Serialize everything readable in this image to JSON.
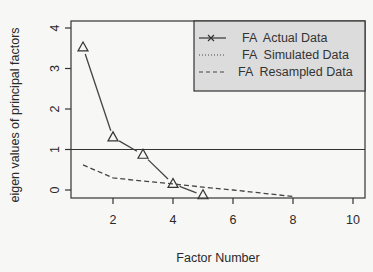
{
  "chart_data": {
    "type": "line",
    "title": "",
    "xlabel": "Factor Number",
    "ylabel": "eigen values of principal factors",
    "xlim": [
      0.6,
      10.4
    ],
    "ylim": [
      -0.2,
      4.1
    ],
    "xticks": [
      2,
      4,
      6,
      8,
      10
    ],
    "yticks": [
      0,
      1,
      2,
      3,
      4
    ],
    "grid": false,
    "reference_line": {
      "y": 1
    },
    "legend": {
      "placement": "top-right",
      "entries": [
        {
          "label": "FA  Actual Data",
          "style": "solid-with-x"
        },
        {
          "label": "FA  Simulated Data",
          "style": "dotted"
        },
        {
          "label": "FA  Resampled Data",
          "style": "dashed"
        }
      ]
    },
    "series": [
      {
        "name": "FA Actual Data",
        "style": "solid",
        "marker": "triangle",
        "x": [
          1,
          2,
          3,
          4,
          5
        ],
        "values": [
          3.52,
          1.3,
          0.87,
          0.15,
          -0.13
        ]
      },
      {
        "name": "FA Resampled Data",
        "style": "dashed",
        "x": [
          1,
          2,
          3,
          4,
          5,
          6,
          7,
          8
        ],
        "values": [
          0.62,
          0.3,
          0.22,
          0.15,
          0.07,
          0.0,
          -0.08,
          -0.16
        ]
      }
    ]
  }
}
